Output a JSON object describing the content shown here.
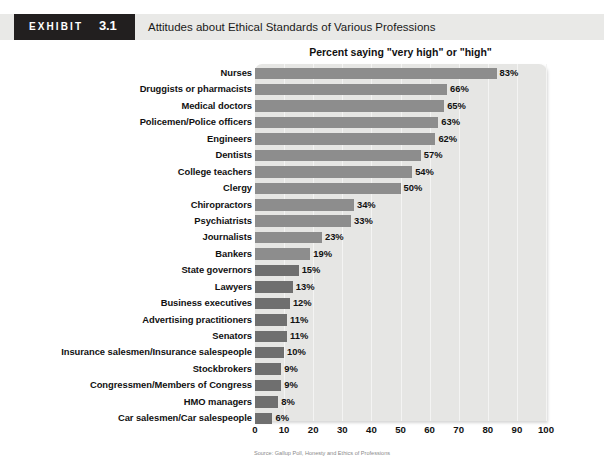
{
  "header": {
    "exhibit_word": "EXHIBIT",
    "exhibit_number": "3.1",
    "title": "Attitudes about Ethical Standards of Various Professions"
  },
  "source_note": "Source: Gallup Poll, Honesty and Ethics of Professions",
  "chart_data": {
    "type": "bar",
    "orientation": "horizontal",
    "title": "Percent saying \"very high\" or \"high\"",
    "xlabel": "",
    "ylabel": "",
    "xlim": [
      0,
      100
    ],
    "grid": true,
    "legend": false,
    "tick_labels": [
      "0",
      "10",
      "20",
      "30",
      "40",
      "50",
      "60",
      "70",
      "80",
      "90",
      "100"
    ],
    "ticks": [
      0,
      10,
      20,
      30,
      40,
      50,
      60,
      70,
      80,
      90,
      100
    ],
    "categories": [
      "Nurses",
      "Druggists or pharmacists",
      "Medical doctors",
      "Policemen/Police officers",
      "Engineers",
      "Dentists",
      "College teachers",
      "Clergy",
      "Chiropractors",
      "Psychiatrists",
      "Journalists",
      "Bankers",
      "State governors",
      "Lawyers",
      "Business executives",
      "Advertising practitioners",
      "Senators",
      "Insurance salesmen/Insurance salespeople",
      "Stockbrokers",
      "Congressmen/Members of Congress",
      "HMO managers",
      "Car salesmen/Car salespeople"
    ],
    "values": [
      83,
      66,
      65,
      63,
      62,
      57,
      54,
      50,
      34,
      33,
      23,
      19,
      15,
      13,
      12,
      11,
      11,
      10,
      9,
      9,
      8,
      6
    ],
    "value_labels": [
      "83%",
      "66%",
      "65%",
      "63%",
      "62%",
      "57%",
      "54%",
      "50%",
      "34%",
      "33%",
      "23%",
      "19%",
      "15%",
      "13%",
      "12%",
      "11%",
      "11%",
      "10%",
      "9%",
      "9%",
      "8%",
      "6%"
    ],
    "colors": {
      "bar": "#8d8d8d",
      "bar_dark": "#6f6f6f",
      "plot_background": "#e6e6e4",
      "gridline": "#f4f4f3",
      "text": "#111111",
      "header_tag_background": "#221f1f",
      "header_banner_background": "#e9e9e7"
    }
  }
}
